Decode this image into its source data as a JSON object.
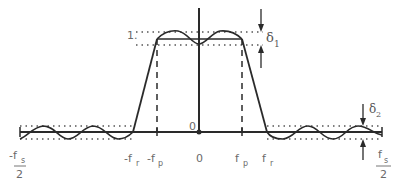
{
  "diagram": {
    "labels": {
      "one": "1.",
      "origin_small": "0",
      "neg_fs_num": "-f",
      "neg_fs_sub": "s",
      "neg_fs_den": "2",
      "neg_fr": "-f",
      "neg_fr_sub": "r",
      "neg_fp": "-f",
      "neg_fp_sub": "p",
      "zero": "0",
      "fp": "f",
      "fp_sub": "p",
      "fr": "f",
      "fr_sub": "r",
      "fs_num": "f",
      "fs_sub": "s",
      "fs_den": "2",
      "delta1": "δ",
      "delta1_sub": "1",
      "delta2": "δ",
      "delta2_sub": "2"
    },
    "colors": {
      "line": "#2a2a2a",
      "dotted": "#555555",
      "text": "#6a6a6a"
    }
  }
}
